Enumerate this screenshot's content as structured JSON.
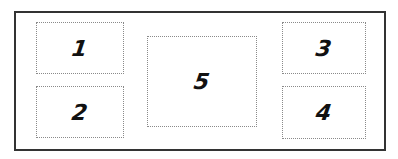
{
  "diagram": {
    "boxes": [
      {
        "id": "1",
        "label": "1"
      },
      {
        "id": "2",
        "label": "2"
      },
      {
        "id": "3",
        "label": "3"
      },
      {
        "id": "4",
        "label": "4"
      },
      {
        "id": "5",
        "label": "5"
      }
    ]
  }
}
